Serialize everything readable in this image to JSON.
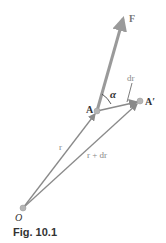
{
  "figure": {
    "caption": "Fig. 10.1",
    "labels": {
      "force": "F",
      "displacement": "dr",
      "angle": "α",
      "point_a": "A",
      "point_a_prime": "A′",
      "position": "r",
      "position_new": "r + dr",
      "origin": "O"
    },
    "points": {
      "O": [
        23,
        208
      ],
      "A": [
        97,
        111
      ],
      "A_prime": [
        140,
        101
      ],
      "F_tip": [
        124,
        14
      ]
    },
    "colors": {
      "vector": "#8a8a8a",
      "force": "#9a9a9a",
      "point": "#b5b5b5",
      "label": "#555555"
    }
  }
}
